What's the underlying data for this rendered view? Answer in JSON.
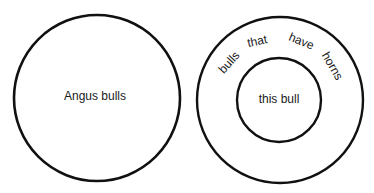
{
  "diagram": {
    "left": {
      "label": "Angus bulls"
    },
    "right": {
      "outer_words": [
        "bulls",
        "that",
        "have",
        "horns"
      ],
      "inner_label": "this bull"
    },
    "colors": {
      "stroke": "#111111",
      "background": "#ffffff"
    }
  }
}
